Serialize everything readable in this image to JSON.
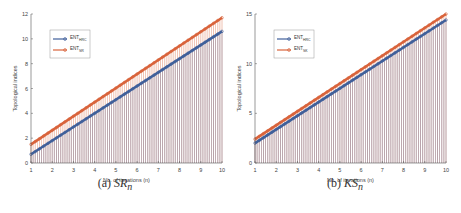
{
  "chart_data": [
    {
      "type": "line",
      "subtype": "stem",
      "caption": "(a) SR_n",
      "caption_label": "(a)",
      "caption_math": "SR",
      "caption_sub": "n",
      "xlabel": "No. of iterations (n)",
      "ylabel": "Topological indices",
      "xlim": [
        1,
        10
      ],
      "ylim": [
        0,
        12
      ],
      "xticks": [
        "1",
        "2",
        "3",
        "4",
        "5",
        "6",
        "7",
        "8",
        "9",
        "10"
      ],
      "yticks": [
        "0",
        "2",
        "4",
        "6",
        "8",
        "10",
        "12"
      ],
      "grid": false,
      "legend_position": "upper-left",
      "series": [
        {
          "name": "ENT_HRC_n",
          "legend_main": "ENT",
          "legend_sub": "HRC",
          "color": "#3f5f9a",
          "x": [
            1,
            10
          ],
          "values": [
            0.7,
            10.6
          ]
        },
        {
          "name": "ENT_SR_n",
          "legend_main": "ENT",
          "legend_sub": "SR",
          "color": "#d9633b",
          "x": [
            1,
            10
          ],
          "values": [
            1.5,
            11.7
          ]
        }
      ]
    },
    {
      "type": "line",
      "subtype": "stem",
      "caption": "(b) KS_n",
      "caption_label": "(b)",
      "caption_math": "KS",
      "caption_sub": "n",
      "xlabel": "No. of iterations (n)",
      "ylabel": "Topological indices",
      "xlim": [
        1,
        10
      ],
      "ylim": [
        0,
        15
      ],
      "xticks": [
        "1",
        "2",
        "3",
        "4",
        "5",
        "6",
        "7",
        "8",
        "9",
        "10"
      ],
      "yticks": [
        "0",
        "5",
        "10",
        "15"
      ],
      "grid": false,
      "legend_position": "upper-left",
      "series": [
        {
          "name": "ENT_HRC_n",
          "legend_main": "ENT",
          "legend_sub": "HRC",
          "color": "#3f5f9a",
          "x": [
            1,
            10
          ],
          "values": [
            2.0,
            14.4
          ]
        },
        {
          "name": "ENT_SK_n",
          "legend_main": "ENT",
          "legend_sub": "SK",
          "color": "#d9633b",
          "x": [
            1,
            10
          ],
          "values": [
            2.4,
            15.0
          ]
        }
      ]
    }
  ]
}
